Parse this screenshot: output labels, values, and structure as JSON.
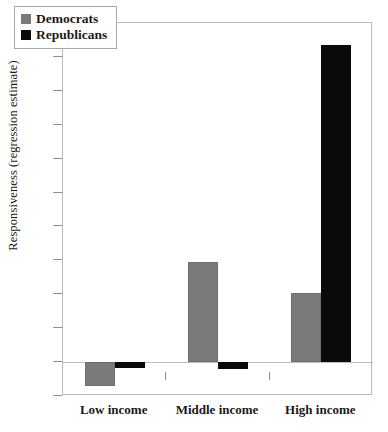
{
  "chart_data": {
    "type": "bar",
    "title": "",
    "xlabel": "",
    "ylabel": "Responsiveness (regression estimate)",
    "categories": [
      "Low income",
      "Middle income",
      "High income"
    ],
    "series": [
      {
        "name": "Democrats",
        "color": "#7a7a7a",
        "values": [
          -1.4,
          5.9,
          4.1
        ]
      },
      {
        "name": "Republicans",
        "color": "#0a0a0a",
        "values": [
          -0.35,
          -0.4,
          18.7
        ]
      }
    ],
    "ylim": [
      -2,
      20
    ],
    "ytick_values": [
      -2,
      0,
      2,
      4,
      6,
      8,
      10,
      12,
      14,
      16,
      18,
      20
    ],
    "ytick_labels": [
      "−2",
      "0",
      "2",
      "4",
      "6",
      "8",
      "10",
      "12",
      "14",
      "16",
      "18",
      "20"
    ],
    "grid": false,
    "legend_position": "top-left",
    "legend_entries": [
      "Democrats",
      "Republicans"
    ]
  }
}
